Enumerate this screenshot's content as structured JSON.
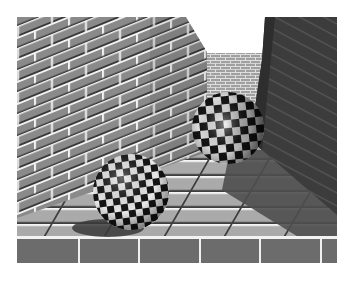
{
  "scene": {
    "description": "Ray-traced corridor of grey brick walls with two black-and-white checkered spheres resting on a tiled floor",
    "frame": {
      "x": 17,
      "y": 17,
      "width": 320,
      "height": 246
    },
    "colors": {
      "background": "#ffffff",
      "sky": "#ffffff",
      "left_wall": "#8a8a8a",
      "left_wall_mortar": "#f0f0f0",
      "far_wall": "#9a9a9a",
      "right_wall_shadow": "#3c3c3c",
      "floor_lit": "#a8a8a8",
      "floor_shadow": "#505050",
      "floor_front_face": "#6e6e6e",
      "checker_dark": "#141414",
      "checker_light": "#e8e8e8"
    },
    "objects": [
      {
        "name": "front-sphere",
        "cx": 131,
        "cy": 192,
        "r": 38
      },
      {
        "name": "back-sphere",
        "cx": 228,
        "cy": 128,
        "r": 36
      }
    ]
  }
}
